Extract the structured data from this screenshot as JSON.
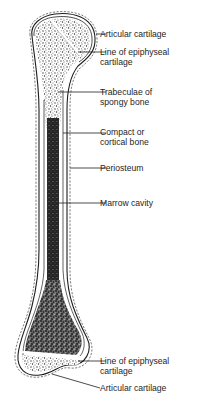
{
  "figure": {
    "labels": {
      "articular_cartilage_top": "Articular cartilage",
      "epiphyseal_line_top": [
        "Line of epiphyseal",
        "cartilage"
      ],
      "trabeculae": [
        "Trabeculae of",
        "spongy bone"
      ],
      "compact_bone": [
        "Compact or",
        "cortical bone"
      ],
      "periosteum": "Periosteum",
      "marrow_cavity": "Marrow cavity",
      "epiphyseal_line_bottom": [
        "Line of epiphyseal",
        "cartilage"
      ],
      "articular_cartilage_bottom": "Articular cartilage"
    },
    "caption_fragment": ""
  },
  "colors": {
    "outline": "#1e1e1e",
    "spongy": "#8a8a8a",
    "marrow": "#2a2a2a",
    "background": "#ffffff"
  }
}
